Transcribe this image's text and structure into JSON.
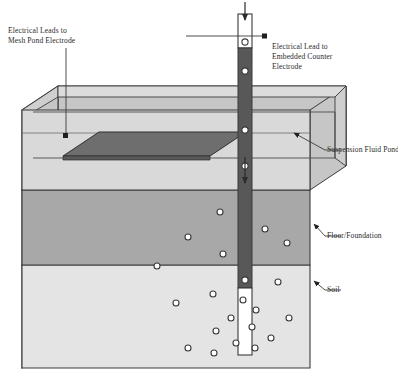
{
  "figure": {
    "width": 398,
    "height": 383,
    "type": "technical-cutaway-diagram"
  },
  "labels": {
    "mesh_lead": {
      "line1": "Electrical Leads to",
      "line2": "Mesh Pond Electrode",
      "anchor_x": 66,
      "anchor_y": 135
    },
    "counter_lead": {
      "line1": "Electrical Lead to",
      "line2": "Embedded Counter",
      "line3": "Electrode",
      "anchor_x": 256,
      "anchor_y": 36
    },
    "pond": {
      "text": "Suspension Fluid Pond",
      "anchor_x": 291,
      "anchor_y": 131
    },
    "floor": {
      "text": "Floor/Foundation",
      "anchor_x": 312,
      "anchor_y": 222
    },
    "soil": {
      "text": "Soil",
      "anchor_x": 312,
      "anchor_y": 279
    }
  },
  "colors": {
    "outline": "#3a3a3a",
    "fluid_front": "#d9d9d9",
    "fluid_side": "#c6c6c6",
    "fluid_top_rim": "#cfcfcf",
    "floor_front": "#a8a8a8",
    "floor_side": "#8f8f8f",
    "soil_front": "#e4e4e4",
    "soil_side": "#cfcfcf",
    "mesh_electrode": "#6e6e6e",
    "rod_upper": "#ffffff",
    "rod_embedded": "#585858",
    "rod_lower": "#ffffff",
    "particle_fill": "#ffffff",
    "particle_stroke": "#3a3a3a",
    "label_text": "#2b2b2b"
  },
  "geometry": {
    "box": {
      "front_left_x": 22,
      "front_right_x": 310,
      "back_left_x": 58,
      "back_right_x": 346,
      "top_front_y": 110,
      "top_back_y": 86,
      "bottom_front_y": 368,
      "bottom_back_y": 344
    },
    "layers": [
      {
        "name": "suspension-fluid-pond",
        "front_top_y": 110,
        "front_bottom_y": 190
      },
      {
        "name": "floor-foundation",
        "front_top_y": 190,
        "front_bottom_y": 265
      },
      {
        "name": "soil",
        "front_top_y": 265,
        "front_bottom_y": 368
      }
    ],
    "mesh_electrode": {
      "front_left_x": 63,
      "front_left_y": 156,
      "front_right_x": 210,
      "front_right_y": 156,
      "back_right_x": 246,
      "back_right_y": 132,
      "back_left_x": 99,
      "back_left_y": 132
    },
    "rod": {
      "x": 238,
      "width": 14,
      "top_y": 14,
      "bottom_y": 355,
      "embedded_start_y": 48,
      "embedded_end_y": 288
    }
  },
  "rod_markers": [
    {
      "y": 42,
      "style": "ring"
    },
    {
      "y": 71,
      "style": "ring"
    },
    {
      "y": 130,
      "style": "ring"
    },
    {
      "y": 166,
      "style": "ring"
    },
    {
      "y": 280,
      "style": "ring"
    }
  ],
  "rod_arrows": [
    {
      "x": 245,
      "y_start": 4,
      "y_end": 20,
      "direction": "down"
    },
    {
      "x": 245,
      "y_start": 158,
      "y_end": 182,
      "direction": "down"
    }
  ],
  "particles": [
    {
      "x": 220,
      "y": 212
    },
    {
      "x": 188,
      "y": 237
    },
    {
      "x": 265,
      "y": 229
    },
    {
      "x": 287,
      "y": 243
    },
    {
      "x": 223,
      "y": 254
    },
    {
      "x": 157,
      "y": 266
    },
    {
      "x": 245,
      "y": 276
    },
    {
      "x": 278,
      "y": 282
    },
    {
      "x": 213,
      "y": 294
    },
    {
      "x": 243,
      "y": 300
    },
    {
      "x": 254,
      "y": 310
    },
    {
      "x": 176,
      "y": 303
    },
    {
      "x": 231,
      "y": 318
    },
    {
      "x": 289,
      "y": 318
    },
    {
      "x": 252,
      "y": 327
    },
    {
      "x": 216,
      "y": 331
    },
    {
      "x": 271,
      "y": 338
    },
    {
      "x": 236,
      "y": 343
    },
    {
      "x": 255,
      "y": 348
    },
    {
      "x": 188,
      "y": 348
    },
    {
      "x": 214,
      "y": 353
    }
  ],
  "leader_lines": {
    "mesh": {
      "from_x": 66,
      "from_y": 48,
      "to_x": 66,
      "to_y": 135,
      "dot_at_end": true
    },
    "counter": {
      "from_x": 186,
      "from_y": 36,
      "to_x": 256,
      "to_y": 36,
      "dot_at_end": true
    },
    "pond": {
      "from_x": 325,
      "from_y": 150,
      "to_x": 291,
      "to_y": 131,
      "arrow_at_end": true
    },
    "floor": {
      "from_x": 325,
      "from_y": 236,
      "to_x": 312,
      "to_y": 222,
      "arrow_at_end": true
    },
    "soil": {
      "from_x": 325,
      "from_y": 290,
      "to_x": 312,
      "to_y": 279,
      "arrow_at_end": true
    }
  }
}
